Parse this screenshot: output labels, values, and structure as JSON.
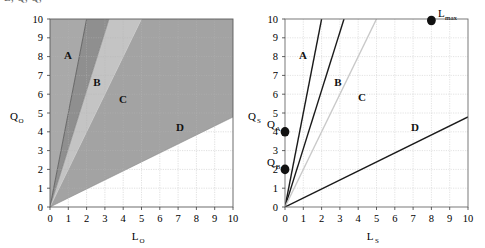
{
  "top_cropped_text": "L, Q, Q,",
  "charts": [
    {
      "id": "left",
      "type": "area",
      "title": "",
      "xlabel": "L",
      "xlabel_sub": "O",
      "ylabel": "Q",
      "ylabel_sub": "O",
      "xlim": [
        0,
        10
      ],
      "ylim": [
        0,
        10
      ],
      "xticks": [
        "0",
        "1",
        "2",
        "3",
        "4",
        "5",
        "6",
        "7",
        "8",
        "9",
        "10"
      ],
      "yticks": [
        "0",
        "1",
        "2",
        "3",
        "4",
        "5",
        "6",
        "7",
        "8",
        "9",
        "10"
      ],
      "grid": true,
      "regions": [
        {
          "label": "A",
          "slope_low": 5.0,
          "slope_high": 1000,
          "color": "#a9a9a9",
          "label_x": 1.1,
          "label_y": 8.4
        },
        {
          "label": "B",
          "slope_low": 3.1,
          "slope_high": 5.0,
          "color": "#8f8f8f",
          "label_x": 2.6,
          "label_y": 7.0
        },
        {
          "label": "C",
          "slope_low": 2.0,
          "slope_high": 3.1,
          "color": "#c4c4c4",
          "label_x": 4.0,
          "label_y": 6.1
        },
        {
          "label": "D",
          "slope_low": 0.48,
          "slope_high": 2.0,
          "color": "#a3a3a3",
          "label_x": 7.1,
          "label_y": 4.6
        }
      ]
    },
    {
      "id": "right",
      "type": "line",
      "title": "",
      "xlabel": "L",
      "xlabel_sub": "S",
      "ylabel": "Q",
      "ylabel_sub": "S",
      "xlim": [
        0,
        10
      ],
      "ylim": [
        0,
        10
      ],
      "xticks": [
        "0",
        "1",
        "2",
        "3",
        "4",
        "5",
        "6",
        "7",
        "8",
        "9",
        "10"
      ],
      "yticks": [
        "0",
        "1",
        "2",
        "3",
        "4",
        "5",
        "6",
        "7",
        "8",
        "9",
        "10"
      ],
      "grid": true,
      "lines": [
        {
          "name": "boundary-1",
          "slope": 5.0,
          "color": "#1a1a1a",
          "width": 1.4
        },
        {
          "name": "boundary-2",
          "slope": 3.1,
          "color": "#1a1a1a",
          "width": 1.4
        },
        {
          "name": "boundary-3",
          "slope": 2.0,
          "color": "#c9c9c9",
          "width": 1.4
        },
        {
          "name": "boundary-4",
          "slope": 0.48,
          "color": "#1a1a1a",
          "width": 1.4
        }
      ],
      "region_labels": [
        {
          "label": "A",
          "x": 1.1,
          "y": 8.4
        },
        {
          "label": "B",
          "x": 2.9,
          "y": 7.0
        },
        {
          "label": "C",
          "x": 4.2,
          "y": 6.3
        },
        {
          "label": "D",
          "x": 7.1,
          "y": 4.6
        }
      ],
      "points": [
        {
          "name": "L-max",
          "x": 8.0,
          "y": 10.0,
          "label": "L",
          "label_sub": "max"
        },
        {
          "name": "Q-A",
          "x": 0.0,
          "y": 4.0,
          "label": "Q",
          "label_sub": "A"
        },
        {
          "name": "Q-B",
          "x": 0.0,
          "y": 2.0,
          "label": "Q",
          "label_sub": "B"
        }
      ]
    }
  ]
}
